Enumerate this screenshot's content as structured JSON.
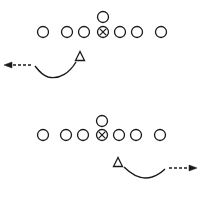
{
  "colors": {
    "background": "#ffffff",
    "stroke": "#1a1a1a"
  },
  "diagrams": [
    {
      "id": "formation-top",
      "center_circle": {
        "cx": 103,
        "cy": 17,
        "r": 5.5
      },
      "line": {
        "cy": 32,
        "r": 5.5,
        "players": [
          {
            "cx": 43,
            "type": "circle"
          },
          {
            "cx": 67,
            "type": "circle"
          },
          {
            "cx": 84,
            "type": "circle"
          },
          {
            "cx": 103,
            "type": "center-x"
          },
          {
            "cx": 120,
            "type": "circle"
          },
          {
            "cx": 137,
            "type": "circle"
          },
          {
            "cx": 161,
            "type": "circle"
          }
        ]
      },
      "triangle": {
        "cx": 80,
        "cy": 56,
        "size": 9
      },
      "route": {
        "curve": "M 76 62 C 70 72, 60 80, 48 77 C 42 75, 38 70, 35 66",
        "dash": "M 31 65 L 10 65",
        "arrow_head": "M 4 65 L 12 62 L 12 68 Z",
        "direction": "left"
      }
    },
    {
      "id": "formation-bottom",
      "center_circle": {
        "cx": 102,
        "cy": 121,
        "r": 5.5
      },
      "line": {
        "cy": 135,
        "r": 5.5,
        "players": [
          {
            "cx": 43,
            "type": "circle"
          },
          {
            "cx": 66,
            "type": "circle"
          },
          {
            "cx": 83,
            "type": "circle"
          },
          {
            "cx": 102,
            "type": "center-x"
          },
          {
            "cx": 119,
            "type": "circle"
          },
          {
            "cx": 136,
            "type": "circle"
          },
          {
            "cx": 160,
            "type": "circle"
          }
        ]
      },
      "triangle": {
        "cx": 118,
        "cy": 162,
        "size": 9
      },
      "route": {
        "curve": "M 124 167 C 132 175, 142 180, 152 177 C 158 175, 162 172, 165 169",
        "dash": "M 169 168 L 190 168",
        "arrow_head": "M 197 168 L 189 165 L 189 171 Z",
        "direction": "right"
      }
    }
  ]
}
